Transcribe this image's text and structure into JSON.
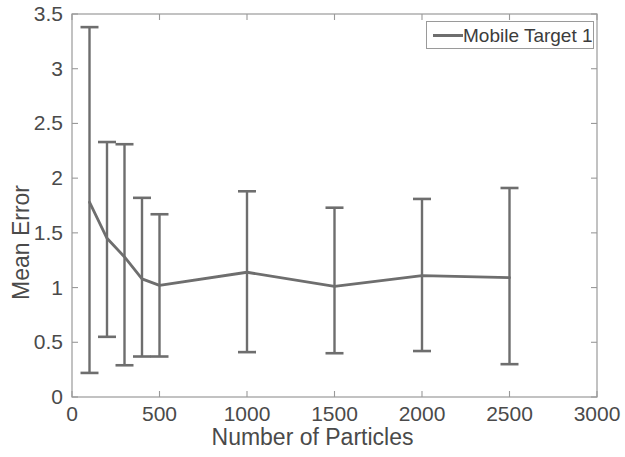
{
  "chart_data": {
    "type": "line",
    "title": "",
    "xlabel": "Number of Particles",
    "ylabel": "Mean Error",
    "xlim": [
      0,
      3000
    ],
    "ylim": [
      0,
      3.5
    ],
    "xticks": [
      0,
      500,
      1000,
      1500,
      2000,
      2500,
      3000
    ],
    "xtick_labels": [
      "0",
      "500",
      "1000",
      "1500",
      "2000",
      "2500",
      "3000"
    ],
    "yticks": [
      0,
      0.5,
      1,
      1.5,
      2,
      2.5,
      3,
      3.5
    ],
    "ytick_labels": [
      "0",
      "0.5",
      "1",
      "1.5",
      "2",
      "2.5",
      "3",
      "3.5"
    ],
    "grid": false,
    "legend_position": "upper right",
    "series": [
      {
        "name": "Mobile Target 1",
        "color": "#6e6e6e",
        "x": [
          100,
          200,
          300,
          400,
          500,
          1000,
          1500,
          2000,
          2500
        ],
        "values": [
          1.78,
          1.45,
          1.28,
          1.08,
          1.02,
          1.14,
          1.01,
          1.11,
          1.09
        ],
        "err_low": [
          0.22,
          0.55,
          0.29,
          0.37,
          0.37,
          0.41,
          0.4,
          0.42,
          0.3
        ],
        "err_high": [
          3.38,
          2.33,
          2.31,
          1.82,
          1.67,
          1.88,
          1.73,
          1.81,
          1.91
        ]
      }
    ]
  },
  "legend": {
    "entries": [
      {
        "label": "Mobile Target 1",
        "color": "#6e6e6e"
      }
    ]
  },
  "axes": {
    "x_title": "Number of Particles",
    "y_title": "Mean Error"
  }
}
